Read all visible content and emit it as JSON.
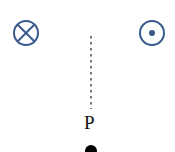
{
  "diagram": {
    "wire_into_page": {
      "symbol": "⊗",
      "cx": 26,
      "cy": 33,
      "r": 12,
      "color": "#3a5a8c"
    },
    "wire_out_of_page": {
      "symbol": "⊙",
      "cx": 152,
      "cy": 33,
      "r": 12,
      "color": "#3a5a8c"
    },
    "dotted_line": {
      "x": 91,
      "y1": 36,
      "y2": 109,
      "color": "#555555"
    },
    "point": {
      "label": "P",
      "x": 91,
      "y": 150,
      "color": "#000000"
    }
  }
}
